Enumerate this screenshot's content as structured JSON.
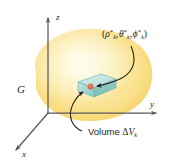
{
  "figure": {
    "background_color": "#ffffff",
    "width": 171,
    "height": 167
  },
  "axes": {
    "color": "#58595b",
    "z_label": "z",
    "y_label": "y",
    "x_label": "x"
  },
  "region": {
    "label": "G",
    "fill_light": "#fdf3c4",
    "fill_mid": "#fbe08a",
    "fill_deep": "#f7d06a"
  },
  "volume_element": {
    "fill": "#a9dcd8",
    "edge": "#5ba8a4",
    "top_fill": "#c7e8e6",
    "point_color": "#e4664c",
    "point_label": "sample point"
  },
  "annotations": {
    "coordinate_label": {
      "open_paren": "(",
      "rho": "ρ",
      "theta": "θ",
      "phi": "ϕ",
      "star": "*",
      "subscript": "k",
      "comma": ",",
      "close_paren": ")",
      "plain_text": "(ρ*k, θ*k, ϕ*k)"
    },
    "volume_label": {
      "word": "Volume",
      "delta": "Δ",
      "v": "V",
      "subscript": "k",
      "plain_text": "Volume ΔVk"
    },
    "leader_color": "#231f20"
  }
}
